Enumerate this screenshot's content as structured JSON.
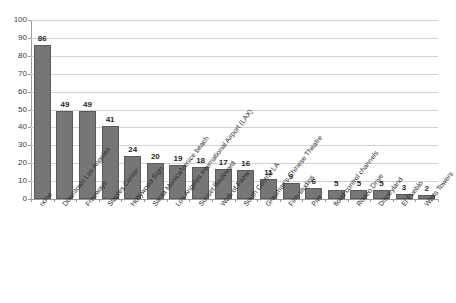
{
  "chart_data": {
    "type": "bar",
    "title": "",
    "subtitle": "",
    "xlabel": "",
    "ylabel": "",
    "ylim": [
      0,
      100
    ],
    "y_ticks": [
      0,
      10,
      20,
      30,
      40,
      50,
      60,
      70,
      80,
      90,
      100
    ],
    "grid": true,
    "legend": false,
    "legend_position": "none",
    "data_labels": true,
    "bar_color": "#767676",
    "bar_border_color": "#5a5a5a",
    "gridline_color": "#d2d2d2",
    "axis_color": "#9a9a9a",
    "categories": [
      "none",
      "Downtown Los Angeles",
      "Freeways",
      "Staples Center",
      "Hollywood Sign",
      "Santa Monica/Venice beach",
      "Los Angeles International Airport (LAX)",
      "Sunset Boulevard",
      "Walk of Fame",
      "South Central LA",
      "Grauman's Chinese Theatre",
      "Film studios",
      "Pier",
      "flood control channels",
      "Rodeo Drive",
      "Disneyland",
      "El Pueblo",
      "Watts Towers"
    ],
    "values": [
      86,
      49,
      49,
      41,
      24,
      20,
      19,
      18,
      17,
      16,
      11,
      9,
      6,
      5,
      5,
      5,
      3,
      2
    ]
  }
}
